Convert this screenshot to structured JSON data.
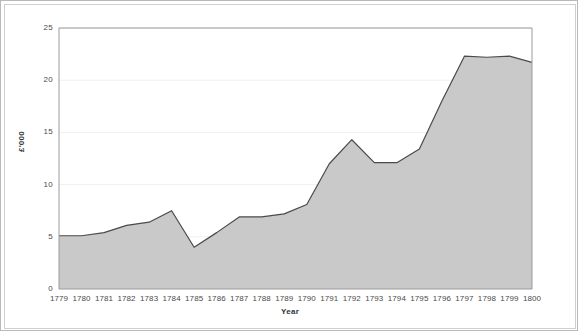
{
  "chart_data": {
    "type": "area",
    "title": "",
    "xlabel": "Year",
    "ylabel": "£'000",
    "categories": [
      "1779",
      "1780",
      "1781",
      "1782",
      "1783",
      "1784",
      "1785",
      "1786",
      "1787",
      "1788",
      "1789",
      "1790",
      "1791",
      "1792",
      "1793",
      "1794",
      "1795",
      "1796",
      "1797",
      "1798",
      "1799",
      "1800"
    ],
    "values": [
      5.1,
      5.1,
      5.4,
      6.1,
      6.4,
      7.5,
      4.0,
      5.4,
      6.9,
      6.9,
      7.2,
      8.1,
      12.0,
      14.3,
      12.1,
      12.1,
      13.4,
      18.0,
      22.3,
      22.2,
      22.3,
      21.7
    ],
    "ylim": [
      0,
      25
    ],
    "ytick_labels": [
      "0",
      "5",
      "10",
      "15",
      "20",
      "25"
    ],
    "ytick_values": [
      0,
      5,
      10,
      15,
      20,
      25
    ],
    "grid": true,
    "legend": false,
    "series": [
      {
        "name": "£'000",
        "values": [
          5.1,
          5.1,
          5.4,
          6.1,
          6.4,
          7.5,
          4.0,
          5.4,
          6.9,
          6.9,
          7.2,
          8.1,
          12.0,
          14.3,
          12.1,
          12.1,
          13.4,
          18.0,
          22.3,
          22.2,
          22.3,
          21.7
        ]
      }
    ],
    "colors": {
      "area_fill": "#c9c9c9",
      "area_line": "#4a4a4a",
      "axis": "#9a9a9a",
      "grid": "#f0f0f0",
      "text": "#4a4a4a",
      "frame": "#b9b9b9",
      "background": "#ffffff"
    }
  }
}
